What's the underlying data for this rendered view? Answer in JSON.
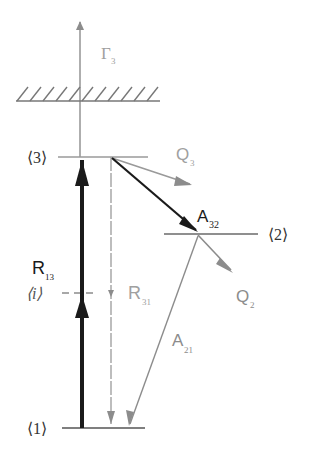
{
  "diagram": {
    "type": "energy-level-diagram",
    "colors": {
      "dark": "#1a1a1a",
      "gray": "#8c8c8c",
      "light_gray": "#a6a6a6"
    },
    "levels": [
      {
        "id": "3",
        "label": "⟨3⟩",
        "y": 157
      },
      {
        "id": "2",
        "label": "⟨2⟩",
        "y": 234
      },
      {
        "id": "i",
        "label": "⟨i⟩",
        "y": 293,
        "style": "dashed"
      },
      {
        "id": "1",
        "label": "⟨1⟩",
        "y": 428
      }
    ],
    "continuum": {
      "label": "ionization limit (hatched)"
    },
    "transitions": {
      "gamma3": {
        "symbol": "Γ",
        "sub": "3"
      },
      "q3": {
        "symbol": "Q",
        "sub": "3"
      },
      "a32": {
        "symbol": "A",
        "sub": "32"
      },
      "r13": {
        "symbol": "R",
        "sub": "13"
      },
      "r31": {
        "symbol": "R",
        "sub": "31"
      },
      "q2": {
        "symbol": "Q",
        "sub": "2"
      },
      "a21": {
        "symbol": "A",
        "sub": "21"
      }
    }
  }
}
